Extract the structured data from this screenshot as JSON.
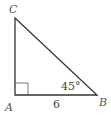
{
  "diagram": {
    "type": "right-triangle",
    "vertices": {
      "A": {
        "label": "A"
      },
      "B": {
        "label": "B"
      },
      "C": {
        "label": "C"
      }
    },
    "angle_B_label": "45°",
    "side_AB_label": "6",
    "right_angle_at": "A",
    "stroke_color": "#333333"
  }
}
